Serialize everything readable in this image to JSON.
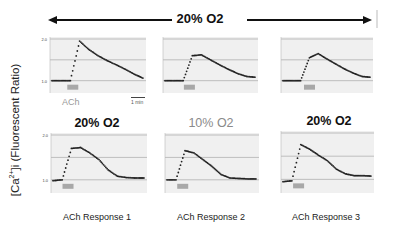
{
  "figure": {
    "top_condition": "20% O2",
    "y_axis_label": "[Ca2+]i (Fluorescent Ratio)",
    "stim_label": "ACh",
    "scale_bar_label": "1 min",
    "ytick_top": "2.0",
    "ytick_bottom": "1.0",
    "bottom_titles": [
      "20% O2",
      "10% O2",
      "20% O2"
    ],
    "captions": [
      "ACh Response 1",
      "ACh Response 2",
      "ACh Response 3"
    ]
  },
  "colors": {
    "trace": "#222222",
    "stim_bar": "#a8a8a8",
    "panel_bg": "#f0f0f0",
    "grid": "#9a9a9a",
    "gray_title": "#8a8a8a"
  },
  "chart_data": [
    {
      "type": "line",
      "panel": "top-1",
      "condition": "20% O2",
      "title": "",
      "ylim": [
        1.0,
        2.0
      ],
      "x": [
        0,
        1,
        2,
        3,
        4,
        5,
        6,
        7,
        8,
        9,
        10
      ],
      "values": [
        1.0,
        1.0,
        1.0,
        1.95,
        1.75,
        1.6,
        1.48,
        1.38,
        1.27,
        1.15,
        1.05
      ],
      "stim_bar": "ACh",
      "scale_bar": "1 min"
    },
    {
      "type": "line",
      "panel": "top-2",
      "condition": "20% O2",
      "ylim": [
        1.0,
        2.0
      ],
      "x": [
        0,
        1,
        2,
        3,
        4,
        5,
        6,
        7,
        8,
        9,
        10
      ],
      "values": [
        1.0,
        1.0,
        1.0,
        1.6,
        1.62,
        1.5,
        1.38,
        1.27,
        1.17,
        1.1,
        1.08
      ]
    },
    {
      "type": "line",
      "panel": "top-3",
      "condition": "20% O2",
      "ylim": [
        1.0,
        2.0
      ],
      "x": [
        0,
        1,
        2,
        3,
        4,
        5,
        6,
        7,
        8,
        9,
        10
      ],
      "values": [
        1.0,
        1.0,
        1.0,
        1.55,
        1.65,
        1.52,
        1.4,
        1.28,
        1.18,
        1.1,
        1.08
      ]
    },
    {
      "type": "line",
      "panel": "bottom-1",
      "title": "20% O2",
      "ylim": [
        1.0,
        2.0
      ],
      "x": [
        0,
        1,
        2,
        3,
        4,
        5,
        6,
        7,
        8,
        9,
        10
      ],
      "values": [
        0.98,
        1.0,
        1.7,
        1.72,
        1.6,
        1.45,
        1.22,
        1.08,
        1.05,
        1.04,
        1.04
      ]
    },
    {
      "type": "line",
      "panel": "bottom-2",
      "title": "10% O2",
      "ylim": [
        1.0,
        2.0
      ],
      "x": [
        0,
        1,
        2,
        3,
        4,
        5,
        6,
        7,
        8,
        9,
        10
      ],
      "values": [
        1.0,
        1.0,
        1.65,
        1.6,
        1.45,
        1.3,
        1.12,
        1.04,
        1.03,
        1.02,
        1.02
      ]
    },
    {
      "type": "line",
      "panel": "bottom-3",
      "title": "20% O2",
      "ylim": [
        1.0,
        2.0
      ],
      "x": [
        0,
        1,
        2,
        3,
        4,
        5,
        6,
        7,
        8,
        9,
        10
      ],
      "values": [
        0.95,
        0.97,
        1.75,
        1.65,
        1.52,
        1.4,
        1.22,
        1.12,
        1.08,
        1.08,
        1.07
      ]
    }
  ]
}
